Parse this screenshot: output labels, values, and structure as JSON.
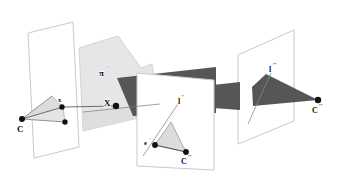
{
  "figure": {
    "background_color": "#ffffff",
    "width": 343,
    "height": 180,
    "colors": {
      "plane_outline": "#c9c9c9",
      "light_fill": "#e6e6e6",
      "mid_fill": "#d6d6d6",
      "dark_fill": "#565656",
      "point_fill": "#111111",
      "ray_stroke": "#555555",
      "label_color": "#111111"
    }
  },
  "labels": {
    "camera_center_1": "C",
    "image_point_1": "x",
    "space_point": "X",
    "plane": "π",
    "plane_prime": "′",
    "line_2": "l",
    "line_2_prime": "′",
    "epipole_2": "e",
    "epipole_2_prime": "′",
    "camera_center_2": "C",
    "camera_center_2_primes": "′′",
    "line_3": "l",
    "line_3_primes": "′′",
    "camera_center_3": "C",
    "camera_center_3_primes": "′′"
  },
  "elements": {
    "planes": [
      {
        "name": "image-plane-left",
        "points": "28,33 73,22 79,147 34,158"
      },
      {
        "name": "plane-pi-prime",
        "points": "79,46 115,33 125,76 133,70 138,113 82,127"
      },
      {
        "name": "image-plane-middle",
        "points": "137,73 213,79 213,170 137,166"
      },
      {
        "name": "image-plane-right",
        "points": "238,55 293,30 293,120 238,143"
      }
    ],
    "dark_wedge": {
      "name": "dark-epipolar-wedge",
      "segments": [
        "112,80 214,70 214,110 131,114",
        "213,85 238,83 238,109 213,107",
        "252,86 263,76 318,105 254,105"
      ]
    },
    "cone_left": {
      "name": "left-camera-cone",
      "apex": {
        "x": 22,
        "y": 119
      },
      "rays": [
        {
          "x": 61,
          "y": 108
        },
        {
          "x": 65,
          "y": 121
        },
        {
          "x": 52,
          "y": 98
        }
      ]
    },
    "cone_middle": {
      "name": "middle-camera-triangle",
      "vertices": "155,145 185,152 170,122"
    },
    "points": [
      {
        "name": "point-C",
        "x": 22,
        "y": 119,
        "r": 2.8
      },
      {
        "name": "point-x",
        "x": 61,
        "y": 108,
        "r": 2.6
      },
      {
        "name": "point-lower-ray",
        "x": 65,
        "y": 121,
        "r": 2.6
      },
      {
        "name": "point-X",
        "x": 116,
        "y": 106,
        "r": 3.0
      },
      {
        "name": "point-e-prime",
        "x": 155,
        "y": 145,
        "r": 2.8
      },
      {
        "name": "point-C-double-prime-mid",
        "x": 185,
        "y": 152,
        "r": 2.8
      },
      {
        "name": "point-C-double-prime-right",
        "x": 318,
        "y": 100,
        "r": 3.0
      }
    ]
  }
}
